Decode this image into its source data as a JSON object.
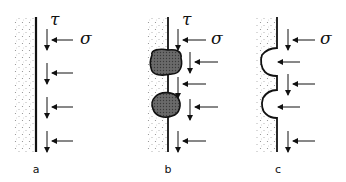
{
  "figure": {
    "panels": [
      {
        "id": "a",
        "label": "a",
        "tau": "τ",
        "sigma": "σ",
        "wall_type": "smooth"
      },
      {
        "id": "b",
        "label": "b",
        "tau": "τ",
        "sigma": "σ",
        "wall_type": "with-deposits"
      },
      {
        "id": "c",
        "label": "c",
        "tau": "",
        "sigma": "σ",
        "wall_type": "with-cavities"
      }
    ],
    "colors": {
      "line": "#111111",
      "stipple": "#8a8a8a",
      "deposit": "#5a5a5a"
    }
  }
}
